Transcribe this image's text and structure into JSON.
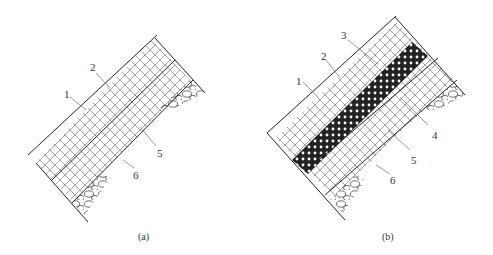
{
  "figure": {
    "panels": [
      {
        "id": "a",
        "caption": "(a)",
        "labels": [
          "1",
          "2",
          "5",
          "6"
        ]
      },
      {
        "id": "b",
        "caption": "(b)",
        "labels": [
          "1",
          "2",
          "3",
          "4",
          "5",
          "6"
        ]
      }
    ],
    "colors": {
      "line": "#222222",
      "leader": "#555555",
      "background": "#ffffff"
    }
  }
}
